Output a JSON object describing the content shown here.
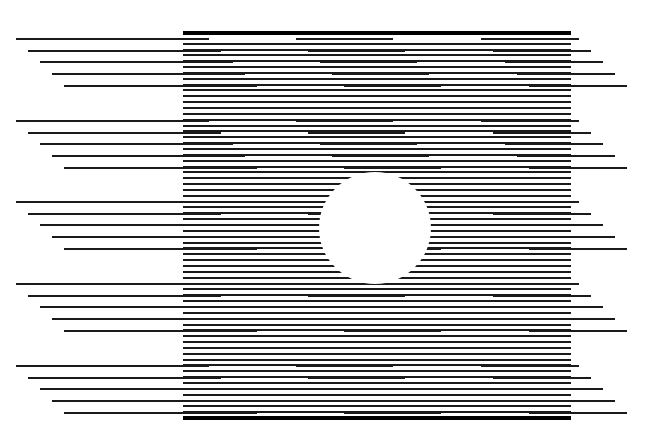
{
  "figure": {
    "title": "Horizontal line optical illusion with central circle",
    "background": "#ffffff",
    "line_color": "#1a1a1a",
    "frame": {
      "x_start": 183,
      "x_end": 571,
      "y_top": 31,
      "y_bottom": 416,
      "thick_height": 4,
      "line_spacing": 5.85,
      "line_height": 2
    },
    "offset_groups": {
      "group_y_starts": [
        38,
        120,
        201,
        283,
        365
      ],
      "rows_per_group": 5,
      "row_step_y": 11.65,
      "row_shift_x": 12,
      "segments": [
        {
          "name": "left",
          "x_start": 16,
          "x_end": 209
        },
        {
          "name": "middle",
          "x_start": 296,
          "x_end": 393
        },
        {
          "name": "right",
          "x_start": 481,
          "x_end": 579
        }
      ]
    },
    "circle": {
      "cx": 375,
      "cy": 228,
      "r": 56
    }
  }
}
